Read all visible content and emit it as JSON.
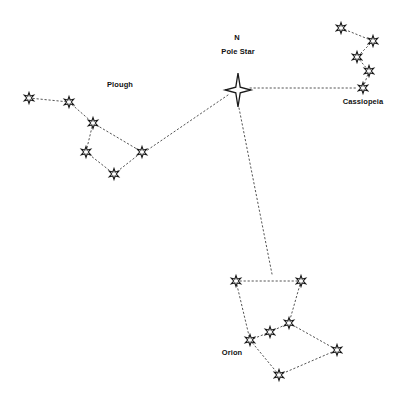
{
  "diagram": {
    "background_color": "#ffffff",
    "line_color": "#555555",
    "star_fill": "#ffffff",
    "star_stroke": "#1a1a1a",
    "width": 398,
    "height": 406
  },
  "labels": [
    {
      "id": "north",
      "text": "N",
      "x": 237,
      "y": 38
    },
    {
      "id": "pole-star",
      "text": "Pole Star",
      "x": 238,
      "y": 52
    },
    {
      "id": "plough",
      "text": "Plough",
      "x": 120,
      "y": 85
    },
    {
      "id": "cassiopeia",
      "text": "Cassiopeia",
      "x": 363,
      "y": 102
    },
    {
      "id": "orion",
      "text": "Orion",
      "x": 232,
      "y": 353
    }
  ],
  "constellations": [
    {
      "name": "Plough",
      "star_type": "six-point",
      "star_size": 11,
      "stars": [
        {
          "id": "plough-1",
          "x": 29,
          "y": 98
        },
        {
          "id": "plough-2",
          "x": 69,
          "y": 102
        },
        {
          "id": "plough-3",
          "x": 93,
          "y": 123
        },
        {
          "id": "plough-4",
          "x": 86,
          "y": 152
        },
        {
          "id": "plough-5",
          "x": 114,
          "y": 174
        },
        {
          "id": "plough-6",
          "x": 142,
          "y": 152
        }
      ],
      "links": [
        [
          "plough-1",
          "plough-2"
        ],
        [
          "plough-2",
          "plough-3"
        ],
        [
          "plough-3",
          "plough-4"
        ],
        [
          "plough-3",
          "plough-6"
        ],
        [
          "plough-4",
          "plough-5"
        ],
        [
          "plough-5",
          "plough-6"
        ]
      ]
    },
    {
      "name": "Cassiopeia",
      "star_type": "six-point",
      "star_size": 11,
      "stars": [
        {
          "id": "cass-1",
          "x": 341,
          "y": 28
        },
        {
          "id": "cass-2",
          "x": 373,
          "y": 41
        },
        {
          "id": "cass-3",
          "x": 357,
          "y": 57
        },
        {
          "id": "cass-4",
          "x": 369,
          "y": 71
        },
        {
          "id": "cass-5",
          "x": 363,
          "y": 88
        }
      ],
      "links": [
        [
          "cass-1",
          "cass-2"
        ],
        [
          "cass-2",
          "cass-3"
        ],
        [
          "cass-3",
          "cass-4"
        ],
        [
          "cass-4",
          "cass-5"
        ]
      ]
    },
    {
      "name": "Orion",
      "star_type": "six-point",
      "star_size": 11,
      "stars": [
        {
          "id": "orion-1",
          "x": 236,
          "y": 281
        },
        {
          "id": "orion-2",
          "x": 301,
          "y": 281
        },
        {
          "id": "orion-3",
          "x": 289,
          "y": 323
        },
        {
          "id": "orion-4",
          "x": 270,
          "y": 332
        },
        {
          "id": "orion-5",
          "x": 250,
          "y": 340
        },
        {
          "id": "orion-6",
          "x": 337,
          "y": 350
        },
        {
          "id": "orion-7",
          "x": 279,
          "y": 375
        }
      ],
      "links": [
        [
          "orion-1",
          "orion-2"
        ],
        [
          "orion-1",
          "orion-5"
        ],
        [
          "orion-2",
          "orion-3"
        ],
        [
          "orion-3",
          "orion-6"
        ],
        [
          "orion-5",
          "orion-4"
        ],
        [
          "orion-4",
          "orion-3"
        ],
        [
          "orion-5",
          "orion-7"
        ],
        [
          "orion-7",
          "orion-6"
        ]
      ]
    }
  ],
  "pole_star": {
    "id": "pole-star-marker",
    "x": 238,
    "y": 90,
    "half_width": 13,
    "half_height": 17,
    "star_type": "four-point"
  },
  "pointer_lines": [
    {
      "id": "pointer-to-plough",
      "from": "pole-star-marker",
      "to": "plough-6",
      "x1": 228,
      "y1": 95,
      "x2": 146,
      "y2": 151
    },
    {
      "id": "pointer-to-cassiopeia",
      "from": "pole-star-marker",
      "to": "cass-5",
      "x1": 250,
      "y1": 88,
      "x2": 357,
      "y2": 88
    },
    {
      "id": "pointer-to-orion",
      "from": "pole-star-marker",
      "to": "orion-2",
      "x1": 239,
      "y1": 108,
      "x2": 272,
      "y2": 274
    }
  ]
}
